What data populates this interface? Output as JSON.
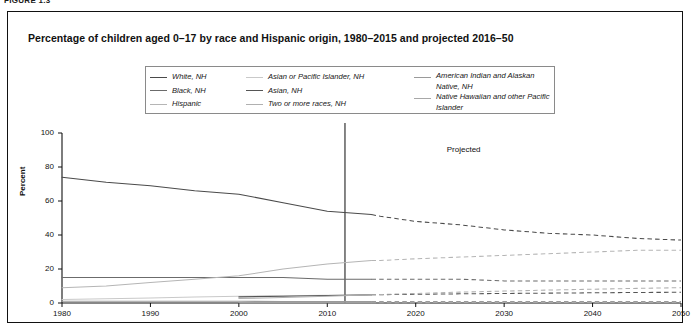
{
  "figure": {
    "number": "FIGURE 1.3",
    "title": "Percentage of children aged 0–17 by race and Hispanic origin, 1980–2015 and projected 2016–50"
  },
  "legend": {
    "columns": [
      [
        {
          "label": "White, NH",
          "color": "#4a4a4a"
        },
        {
          "label": "Black, NH",
          "color": "#6b6b6b"
        },
        {
          "label": "Hispanic",
          "color": "#b5b5b5"
        }
      ],
      [
        {
          "label": "Asian or Pacific Islander, NH",
          "color": "#c9c9c9"
        },
        {
          "label": "Asian, NH",
          "color": "#555555"
        },
        {
          "label": "Two or more races, NH",
          "color": "#b0b0b0"
        }
      ],
      [
        {
          "label": "American Indian and Alaskan Native, NH",
          "color": "#9a9a9a"
        },
        {
          "label": "Native Hawaiian and other Pacific Islander",
          "color": "#a8a8a8"
        }
      ]
    ]
  },
  "annotations": {
    "projected": "Projected",
    "divider_year": 2012
  },
  "chart_data": {
    "type": "line",
    "title": "Percentage of children aged 0–17 by race and Hispanic origin, 1980–2015 and projected 2016–50",
    "xlabel": "",
    "ylabel": "Percent",
    "xlim": [
      1980,
      2050
    ],
    "ylim": [
      0,
      100
    ],
    "xticks": [
      1980,
      1990,
      2000,
      2010,
      2020,
      2030,
      2040,
      2050
    ],
    "yticks": [
      0,
      20,
      40,
      60,
      80,
      100
    ],
    "grid": false,
    "legend_position": "top-center",
    "projection_start_year": 2016,
    "historical_end_year": 2015,
    "divider_year": 2012,
    "annotation": "Projected",
    "x": [
      1980,
      1985,
      1990,
      1995,
      2000,
      2005,
      2010,
      2015,
      2016,
      2020,
      2025,
      2030,
      2035,
      2040,
      2045,
      2050
    ],
    "series": [
      {
        "name": "White, NH",
        "color": "#4a4a4a",
        "values": [
          74,
          71,
          69,
          66,
          64,
          59,
          54,
          52,
          51,
          48,
          46,
          43,
          41,
          40,
          38,
          37
        ]
      },
      {
        "name": "Black, NH",
        "color": "#6b6b6b",
        "values": [
          15,
          15,
          15,
          15,
          15,
          15,
          14,
          14,
          14,
          14,
          14,
          13,
          13,
          13,
          13,
          13
        ]
      },
      {
        "name": "Hispanic",
        "color": "#b5b5b5",
        "values": [
          9,
          10,
          12,
          14,
          16,
          20,
          23,
          25,
          25,
          26,
          27,
          28,
          29,
          30,
          31,
          31
        ]
      },
      {
        "name": "Asian or Pacific Islander, NH",
        "color": "#c9c9c9",
        "values": [
          2,
          2.5,
          3,
          3.5,
          4,
          4.3,
          4.5,
          4.6,
          null,
          null,
          null,
          null,
          null,
          null,
          null,
          null
        ]
      },
      {
        "name": "Asian, NH",
        "color": "#555555",
        "values": [
          null,
          null,
          null,
          null,
          3.6,
          4.0,
          4.4,
          4.8,
          4.9,
          5.1,
          5.4,
          5.6,
          5.8,
          6.0,
          6.2,
          6.3
        ]
      },
      {
        "name": "Two or more races, NH",
        "color": "#b0b0b0",
        "values": [
          null,
          null,
          null,
          null,
          2.6,
          3.2,
          4.0,
          4.8,
          5.0,
          5.6,
          6.4,
          7.0,
          7.6,
          8.1,
          8.6,
          9.0
        ]
      },
      {
        "name": "American Indian and Alaskan Native, NH",
        "color": "#9a9a9a",
        "values": [
          1.0,
          1.0,
          1.0,
          1.0,
          1.0,
          0.9,
          0.9,
          0.9,
          0.9,
          0.9,
          0.9,
          0.8,
          0.8,
          0.8,
          0.8,
          0.8
        ]
      },
      {
        "name": "Native Hawaiian and other Pacific Islander",
        "color": "#a8a8a8",
        "values": [
          null,
          null,
          null,
          null,
          0.2,
          0.2,
          0.2,
          0.2,
          0.2,
          0.2,
          0.3,
          0.3,
          0.3,
          0.3,
          0.3,
          0.3
        ]
      }
    ]
  }
}
